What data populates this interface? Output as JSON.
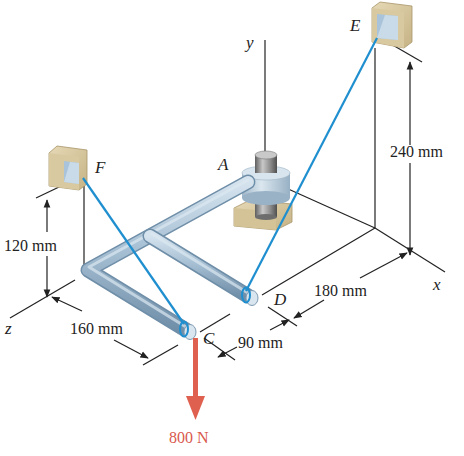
{
  "diagram": {
    "type": "3D statics problem - bent pipe supported by collar and two cables",
    "axes": {
      "x_label": "x",
      "y_label": "y",
      "z_label": "z"
    },
    "points": {
      "A": "A",
      "C": "C",
      "D": "D",
      "E": "E",
      "F": "F"
    },
    "dimensions": {
      "height_E": "240 mm",
      "height_F": "120 mm",
      "z_offset": "160 mm",
      "x_offset": "180 mm",
      "cd_offset": "90 mm"
    },
    "load": {
      "label": "800 N",
      "color": "#e0604f"
    },
    "colors": {
      "cable": "#1f8fcf",
      "pipe": "#a9c2d6",
      "pipe_dark": "#7e9bb3",
      "support_block": "#d8c9a2",
      "support_inner": "#b8cfe0",
      "collar": "#c3d6e4",
      "shaft": "#8a8a8a",
      "dimension_line": "#222222"
    }
  }
}
